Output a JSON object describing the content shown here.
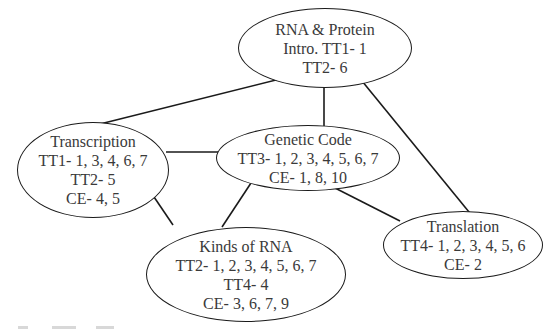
{
  "diagram": {
    "nodes": [
      {
        "id": "rna-protein",
        "lines": [
          "RNA & Protein",
          "Intro. TT1- 1",
          "TT2- 6"
        ]
      },
      {
        "id": "transcription",
        "lines": [
          "Transcription",
          "TT1- 1, 3, 4, 6, 7",
          "TT2- 5",
          "CE- 4, 5"
        ]
      },
      {
        "id": "genetic-code",
        "lines": [
          "Genetic Code",
          "TT3- 1, 2, 3, 4, 5, 6, 7",
          "CE- 1, 8, 10"
        ]
      },
      {
        "id": "kinds-of-rna",
        "lines": [
          "Kinds of RNA",
          "TT2- 1, 2, 3, 4, 5, 6, 7",
          "TT4- 4",
          "CE- 3, 6, 7, 9"
        ]
      },
      {
        "id": "translation",
        "lines": [
          "Translation",
          "TT4- 1, 2, 3, 4, 5, 6",
          "CE- 2"
        ]
      }
    ],
    "edges": [
      [
        "rna-protein",
        "transcription"
      ],
      [
        "rna-protein",
        "genetic-code"
      ],
      [
        "rna-protein",
        "translation"
      ],
      [
        "transcription",
        "genetic-code"
      ],
      [
        "transcription",
        "kinds-of-rna"
      ],
      [
        "genetic-code",
        "kinds-of-rna"
      ],
      [
        "genetic-code",
        "translation"
      ]
    ],
    "colors": {
      "line": "#1a1a1a",
      "text": "#3a3a3a"
    }
  }
}
